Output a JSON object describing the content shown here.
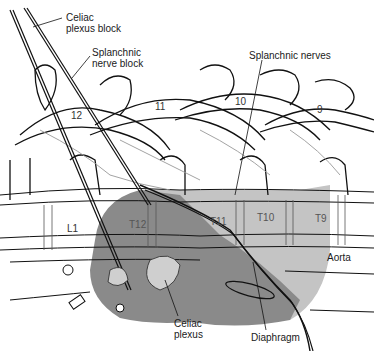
{
  "diagram": {
    "type": "anatomical-illustration",
    "colors": {
      "background": "#ffffff",
      "line": "#111111",
      "light_shade": "#c4c4c4",
      "dark_shade": "#8a8a8a",
      "ganglion": "#cfcfcf"
    },
    "labels": {
      "celiac_block": "Celiac\nplexus block",
      "splanchnic_block": "Splanchnic\nnerve block",
      "splanchnic_nerves": "Splanchnic nerves",
      "aorta": "Aorta",
      "celiac_plexus": "Celiac\nplexus",
      "diaphragm": "Diaphragm"
    },
    "vertebra_numbers": [
      "12",
      "11",
      "10",
      "9"
    ],
    "body_labels": [
      "L1",
      "T12",
      "T11",
      "T10",
      "T9"
    ]
  }
}
